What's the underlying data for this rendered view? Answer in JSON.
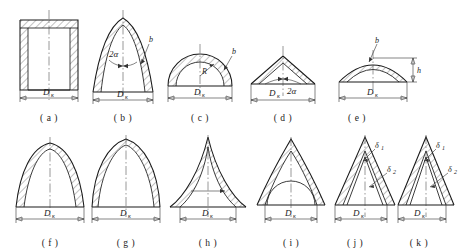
{
  "figure": {
    "row_count": 2,
    "panel_count": 11,
    "line_color": "#1a1a1a",
    "background": "#ffffff",
    "hatch_color": "#333333"
  },
  "symbols": {
    "diameter": "D",
    "diameter_subscript": "к",
    "diameter_label": "Dк",
    "half_angle": "2α",
    "thickness_b": "b",
    "radius_R": "R",
    "height_h": "h",
    "thickness_d1": "δ",
    "thickness_d1_sub": "1",
    "thickness_d2": "δ",
    "thickness_d2_sub": "2"
  },
  "panels": [
    {
      "id": "a",
      "caption": "( a )",
      "shape": "cylindrical-shell-flat-top",
      "labels": [
        "Dк"
      ],
      "has_centerline": true,
      "has_diameter_dim": true
    },
    {
      "id": "b",
      "caption": "( b )",
      "shape": "tall-ogival-dome",
      "labels": [
        "2α",
        "b",
        "Dк"
      ],
      "has_centerline": true,
      "has_diameter_dim": true
    },
    {
      "id": "c",
      "caption": "( c )",
      "shape": "hemispherical-dome",
      "labels": [
        "R",
        "b",
        "Dк"
      ],
      "has_centerline": true,
      "has_diameter_dim": true
    },
    {
      "id": "d",
      "caption": "( d )",
      "shape": "shallow-conical-head",
      "labels": [
        "Dк",
        "2α"
      ],
      "has_centerline": true,
      "has_diameter_dim": true
    },
    {
      "id": "e",
      "caption": "( e )",
      "shape": "shallow-spherical-cap",
      "labels": [
        "b",
        "h",
        "Dк"
      ],
      "has_centerline": true,
      "has_diameter_dim": true
    },
    {
      "id": "f",
      "caption": "( f )",
      "shape": "narrow-rounded-parabolic-dome",
      "labels": [
        "Dк"
      ],
      "has_centerline": true,
      "has_diameter_dim": true
    },
    {
      "id": "g",
      "caption": "( g )",
      "shape": "pointed-parabolic-dome",
      "labels": [
        "Dк"
      ],
      "has_centerline": true,
      "has_diameter_dim": true
    },
    {
      "id": "h",
      "caption": "( h )",
      "shape": "concave-sided-spire",
      "labels": [
        "Dк"
      ],
      "has_centerline": true,
      "has_diameter_dim": true
    },
    {
      "id": "i",
      "caption": "( i )",
      "shape": "pointed-dome-with-inner-arch",
      "labels": [
        "Dк"
      ],
      "has_centerline": true,
      "has_diameter_dim": true
    },
    {
      "id": "j",
      "caption": "( j )",
      "shape": "conical-head-two-thicknesses",
      "labels": [
        "δ1",
        "δ2",
        "Dк"
      ],
      "has_centerline": true,
      "has_diameter_dim": true
    },
    {
      "id": "k",
      "caption": "( k )",
      "shape": "conical-head-two-thicknesses-variant",
      "labels": [
        "δ1",
        "δ2",
        "Dк"
      ],
      "has_centerline": true,
      "has_diameter_dim": true
    }
  ]
}
